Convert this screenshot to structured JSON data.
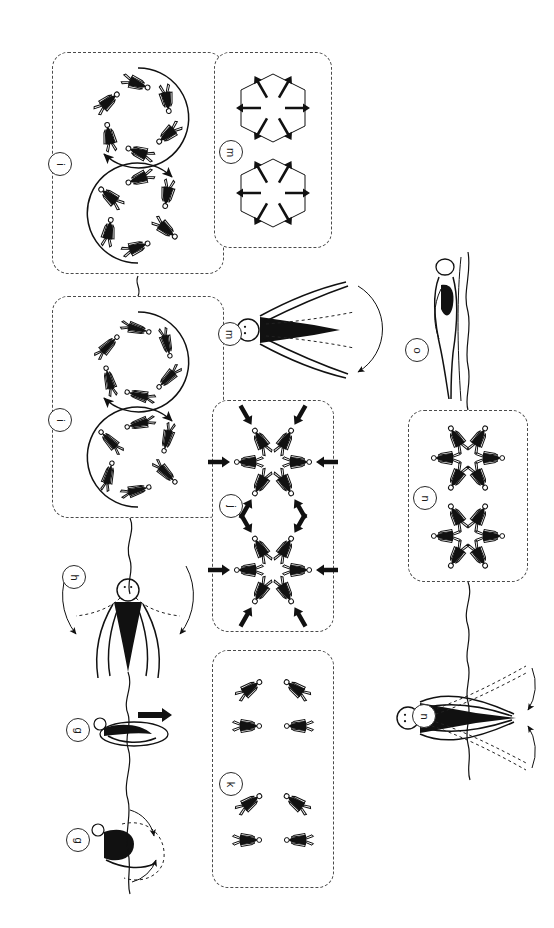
{
  "figure": {
    "background": "#ffffff",
    "ink": "#111111",
    "panel_border": "#4a4a4a",
    "width": 554,
    "height": 928,
    "orientation_note": "page rotated 90 degrees clockwise"
  },
  "panels": [
    {
      "id": "p_i_top",
      "tag": "i",
      "x": 52,
      "y": 52,
      "w": 172,
      "h": 222,
      "caption": "two counter-rotating rings of six walkers"
    },
    {
      "id": "p_m_star",
      "tag": "m",
      "x": 214,
      "y": 52,
      "w": 118,
      "h": 196,
      "caption": "six-pointed star arrow bursts, two stacked"
    },
    {
      "id": "p_i_bottom",
      "tag": "i",
      "x": 52,
      "y": 296,
      "w": 172,
      "h": 222,
      "caption": "two hexagonal rings of six walkers"
    },
    {
      "id": "p_j_rosette",
      "tag": "j",
      "x": 212,
      "y": 400,
      "w": 122,
      "h": 232,
      "caption": "two inward-converging rosettes with black arrows"
    },
    {
      "id": "p_n_rosette",
      "tag": "n",
      "x": 408,
      "y": 410,
      "w": 120,
      "h": 172,
      "caption": "two six-agent outward rosettes"
    },
    {
      "id": "p_k_cluster",
      "tag": "k",
      "x": 212,
      "y": 650,
      "w": 122,
      "h": 238,
      "caption": "two loose triangular clusters of three walkers"
    }
  ],
  "figures": [
    {
      "id": "f_h",
      "tag": "h",
      "tag_x": 62,
      "tag_y": 565,
      "caption": "standing figure with sweeping double arc arm motion"
    },
    {
      "id": "f_g_upper",
      "tag": "g",
      "tag_x": 66,
      "tag_y": 718,
      "caption": "crouched figure with short straight motion arrow"
    },
    {
      "id": "f_g_lower",
      "tag": "g",
      "tag_x": 66,
      "tag_y": 828,
      "caption": "reclining figure with curved motion arrow"
    },
    {
      "id": "f_m_arms",
      "tag": "m",
      "tag_x": 218,
      "tag_y": 322,
      "caption": "front view figure, arms spread with dashed ghost limbs and arc arrow"
    },
    {
      "id": "f_o",
      "tag": "o",
      "tag_x": 405,
      "tag_y": 338,
      "caption": "slim upright figure in profile"
    },
    {
      "id": "f_n_arms",
      "tag": "n",
      "tag_x": 412,
      "tag_y": 704,
      "caption": "front view figure, arms lowered with dashed ghost limbs and arc arrows"
    }
  ],
  "tags": {
    "i": "i",
    "m": "m",
    "j": "j",
    "k": "k",
    "n": "n",
    "o": "o",
    "h": "h",
    "g": "g"
  },
  "connectors": [
    {
      "id": "c1",
      "from": "p_i_top",
      "to": "p_i_bottom",
      "caption": "wavy link between the two i panels"
    },
    {
      "id": "c2",
      "from": "p_i_bottom",
      "to": "f_h",
      "caption": "wavy spine line down to figure h"
    },
    {
      "id": "c3",
      "from": "p_n_rosette",
      "to": "f_n_arms",
      "caption": "wavy spine line from n panel to figure n"
    },
    {
      "id": "c4",
      "from": "f_o",
      "to": "p_n_rosette",
      "caption": "vertical line through the o figure"
    }
  ]
}
